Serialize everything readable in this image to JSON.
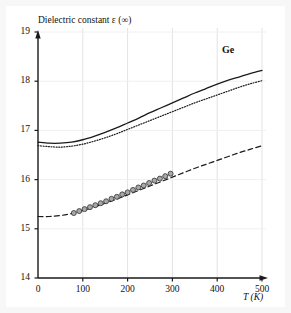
{
  "chart_data": {
    "type": "line",
    "title": "Dielectric constant ε (∞)",
    "xlabel": "T (K)",
    "ylabel": "Dielectric constant ε (∞)",
    "annotation": "Ge",
    "xlim": [
      0,
      500
    ],
    "ylim": [
      14,
      19
    ],
    "xticks": [
      0,
      100,
      200,
      300,
      400,
      500
    ],
    "xtick_labels": [
      "0",
      "100",
      "200",
      "300",
      "400",
      "500"
    ],
    "yticks": [
      14,
      15,
      16,
      17,
      18,
      19
    ],
    "ytick_labels": [
      "14",
      "15",
      "16",
      "17",
      "18",
      "19"
    ],
    "grid": true,
    "legend": "none",
    "series": [
      {
        "name": "upper-solid",
        "style": "solid",
        "color": "#1a1a1a",
        "x": [
          0,
          25,
          50,
          75,
          100,
          125,
          150,
          175,
          200,
          225,
          250,
          275,
          300,
          325,
          350,
          375,
          400,
          425,
          450,
          475,
          500
        ],
        "y": [
          16.76,
          16.74,
          16.74,
          16.76,
          16.81,
          16.88,
          16.96,
          17.05,
          17.15,
          17.25,
          17.36,
          17.46,
          17.56,
          17.66,
          17.76,
          17.85,
          17.94,
          18.02,
          18.09,
          18.16,
          18.22
        ]
      },
      {
        "name": "middle-dotted",
        "style": "dotted",
        "color": "#1a1a1a",
        "x": [
          0,
          25,
          50,
          75,
          100,
          125,
          150,
          175,
          200,
          225,
          250,
          275,
          300,
          325,
          350,
          375,
          400,
          425,
          450,
          475,
          500
        ],
        "y": [
          16.69,
          16.67,
          16.66,
          16.68,
          16.72,
          16.78,
          16.85,
          16.93,
          17.02,
          17.11,
          17.2,
          17.29,
          17.38,
          17.47,
          17.56,
          17.64,
          17.72,
          17.8,
          17.88,
          17.95,
          18.01
        ]
      },
      {
        "name": "lower-dashed",
        "style": "dashed",
        "color": "#1a1a1a",
        "x": [
          0,
          25,
          50,
          75,
          100,
          125,
          150,
          175,
          200,
          225,
          250,
          275,
          300,
          325,
          350,
          375,
          400,
          425,
          450,
          475,
          500
        ],
        "y": [
          15.25,
          15.25,
          15.27,
          15.31,
          15.37,
          15.44,
          15.52,
          15.6,
          15.69,
          15.78,
          15.87,
          15.96,
          16.05,
          16.14,
          16.23,
          16.31,
          16.39,
          16.47,
          16.55,
          16.62,
          16.69
        ]
      }
    ],
    "markers": {
      "name": "experimental-points",
      "shape": "circle",
      "fill": "#a8a8a8",
      "edge": "#303030",
      "x": [
        80,
        92,
        104,
        116,
        128,
        140,
        152,
        164,
        176,
        188,
        200,
        212,
        224,
        236,
        248,
        260,
        272,
        284,
        296
      ],
      "y": [
        15.32,
        15.36,
        15.4,
        15.44,
        15.48,
        15.52,
        15.56,
        15.61,
        15.65,
        15.7,
        15.74,
        15.79,
        15.84,
        15.88,
        15.93,
        15.98,
        16.02,
        16.07,
        16.12
      ]
    }
  }
}
